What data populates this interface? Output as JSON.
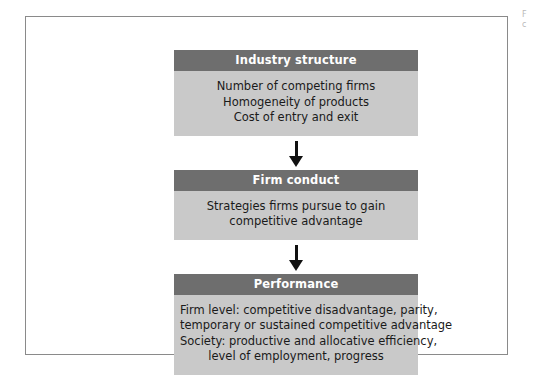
{
  "figure": {
    "frame_border_color": "#8a8a8a",
    "background_color": "#ffffff",
    "header_color": "#6e6e6e",
    "body_color": "#c9c9c9",
    "arrow_color": "#111111"
  },
  "edge_caption": {
    "line1": "F",
    "line2": "c"
  },
  "chart_data": {
    "type": "diagram",
    "title": "",
    "orientation": "vertical-flow",
    "nodes": [
      {
        "id": "industry-structure",
        "header": "Industry structure",
        "lines": [
          "Number of competing firms",
          "Homogeneity of products",
          "Cost of entry and exit"
        ]
      },
      {
        "id": "firm-conduct",
        "header": "Firm conduct",
        "lines": [
          "Strategies firms pursue to gain",
          "competitive advantage"
        ]
      },
      {
        "id": "performance",
        "header": "Performance",
        "lines": [
          "Firm level: competitive disadvantage, parity,",
          "temporary or sustained competitive advantage",
          "Society: productive and allocative efficiency,",
          "level of employment, progress"
        ]
      }
    ],
    "edges": [
      {
        "from": "industry-structure",
        "to": "firm-conduct",
        "style": "solid-down-arrow"
      },
      {
        "from": "firm-conduct",
        "to": "performance",
        "style": "solid-down-arrow"
      }
    ]
  }
}
